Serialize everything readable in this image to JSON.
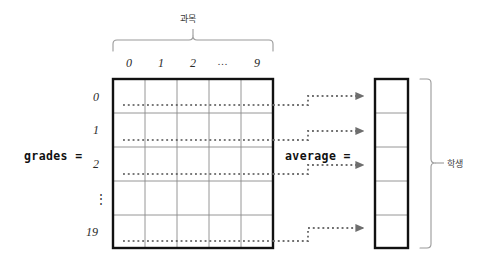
{
  "diagram": {
    "title_alt": "2D array grades and 1D array average",
    "background": "#ffffff",
    "ink": "#1b1b1b",
    "grid_line_color": "#8a8a8a",
    "border_color": "#111111",
    "dotted_color": "#4d4d4d",
    "arrow_color": "#6e6e6e"
  },
  "matrix": {
    "var_label": "grades =",
    "column_axis_label": "과목",
    "column_headers": [
      "0",
      "1",
      "2",
      "...",
      "9"
    ],
    "row_headers": [
      "0",
      "1",
      "2",
      "⋮",
      "19"
    ],
    "rows": 5,
    "cols": 5,
    "dotted_rows": [
      "0",
      "1",
      "2",
      "19"
    ]
  },
  "vector": {
    "var_label": "average =",
    "row_axis_label": "학생",
    "cells": 5,
    "arrow_target_cells": [
      0,
      1,
      2,
      4
    ]
  }
}
